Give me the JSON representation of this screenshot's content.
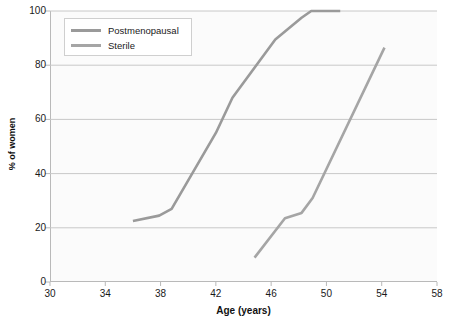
{
  "chart_data": {
    "type": "line",
    "title": "",
    "xlabel": "Age (years)",
    "ylabel": "% of women",
    "xlim": [
      30,
      58
    ],
    "ylim": [
      0,
      100
    ],
    "xticks": [
      30,
      34,
      38,
      42,
      46,
      50,
      54,
      58
    ],
    "yticks": [
      0,
      20,
      40,
      60,
      80,
      100
    ],
    "grid": "horizontal",
    "legend_position": "top-left-inside",
    "series": [
      {
        "name": "Postmenopausal",
        "color": "#9a9a9a",
        "points": [
          {
            "x": 36.0,
            "y": 22.5
          },
          {
            "x": 37.9,
            "y": 24.5
          },
          {
            "x": 38.8,
            "y": 27.0
          },
          {
            "x": 42.0,
            "y": 55.0
          },
          {
            "x": 43.2,
            "y": 68.0
          },
          {
            "x": 46.3,
            "y": 89.5
          },
          {
            "x": 48.2,
            "y": 97.5
          },
          {
            "x": 48.9,
            "y": 100.0
          },
          {
            "x": 51.0,
            "y": 100.0
          }
        ]
      },
      {
        "name": "Sterile",
        "color": "#a5a5a5",
        "points": [
          {
            "x": 44.8,
            "y": 9.0
          },
          {
            "x": 47.0,
            "y": 23.5
          },
          {
            "x": 48.2,
            "y": 25.5
          },
          {
            "x": 49.0,
            "y": 31.0
          },
          {
            "x": 54.2,
            "y": 86.5
          }
        ]
      }
    ]
  },
  "axes": {
    "x_title": "Age (years)",
    "y_title": "% of women",
    "x_tick_labels": [
      "30",
      "34",
      "38",
      "42",
      "46",
      "50",
      "54",
      "58"
    ],
    "y_tick_labels": [
      "0",
      "20",
      "40",
      "60",
      "80",
      "100"
    ]
  },
  "legend": {
    "items": [
      {
        "label": "Postmenopausal"
      },
      {
        "label": "Sterile"
      }
    ]
  },
  "colors": {
    "series_postmenopausal": "#9a9a9a",
    "series_sterile": "#a5a5a5",
    "gridline": "#c8c8c8",
    "axis": "#b9b9b9",
    "plot_background": "#fbfbfb",
    "text": "#1a1a1a"
  }
}
